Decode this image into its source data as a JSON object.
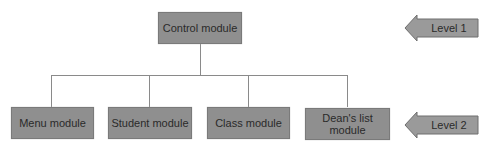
{
  "diagram": {
    "type": "hierarchy-chart",
    "root": {
      "label": "Control module"
    },
    "children": [
      {
        "label": "Menu module"
      },
      {
        "label": "Student module"
      },
      {
        "label": "Class module"
      },
      {
        "label": "Dean's list module"
      }
    ],
    "levels": [
      {
        "label": "Level 1"
      },
      {
        "label": "Level 2"
      }
    ],
    "colors": {
      "box_fill": "#8f8f8f",
      "connector": "#8a8a8a",
      "arrow_fill": "#9a9a9a"
    }
  }
}
